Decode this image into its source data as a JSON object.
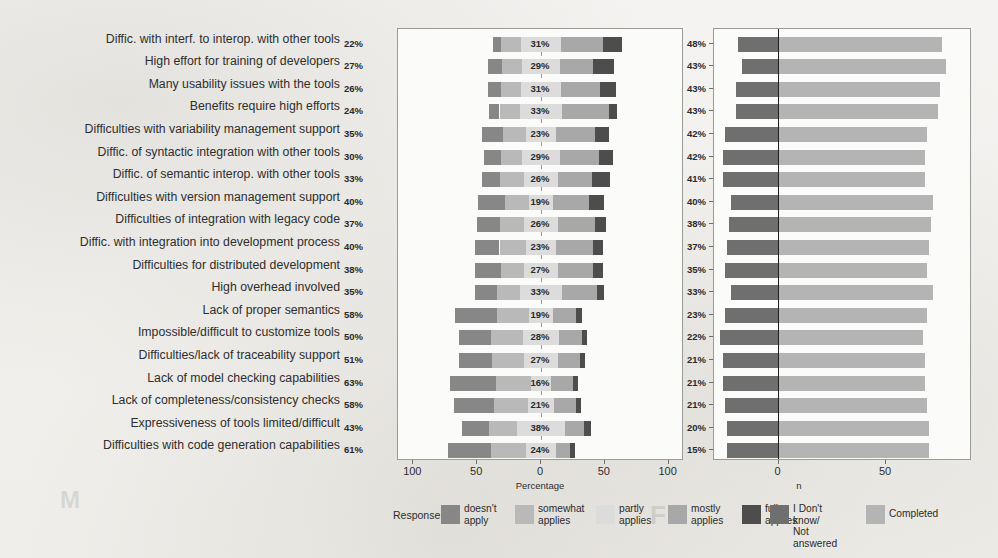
{
  "figure": {
    "left_axis_title": "Percentage",
    "right_axis_title": "n",
    "left_ticks": [
      "100",
      "50",
      "0",
      "50",
      "100"
    ],
    "right_ticks": [
      "0",
      "50"
    ]
  },
  "legend": {
    "left_title": "Response",
    "left_items": [
      {
        "label": "doesn't\napply",
        "color": "#878787"
      },
      {
        "label": "somewhat\napplies",
        "color": "#b9b9b9"
      },
      {
        "label": "partly\napplies",
        "color": "#dcdcdc"
      },
      {
        "label": "mostly\napplies",
        "color": "#a8a8a8"
      },
      {
        "label": "fully\napplies",
        "color": "#4d4d4d"
      }
    ],
    "right_items": [
      {
        "label": "I Don't know/\nNot answered",
        "color": "#6f6f6f"
      },
      {
        "label": "Completed",
        "color": "#b4b4b4"
      }
    ]
  },
  "colors": {
    "doesnt_apply": "#878787",
    "somewhat_applies": "#b9b9b9",
    "partly_applies": "#dcdcdc",
    "mostly_applies": "#a8a8a8",
    "fully_applies": "#4d4d4d",
    "not_answered": "#6f6f6f",
    "completed": "#b4b4b4",
    "panel_border": "#9a9a96",
    "zero_line": "#1f1f1f"
  },
  "chart_data": {
    "type": "bar",
    "title": "",
    "subtype": "diverging-stacked-likert + companion count bar",
    "xlabel": "Percentage",
    "ylabel": "",
    "xlim": [
      -100,
      100
    ],
    "grid": false,
    "legend_position": "bottom",
    "series": [
      {
        "name": "doesn't apply",
        "color": "#878787"
      },
      {
        "name": "somewhat applies",
        "color": "#b9b9b9"
      },
      {
        "name": "partly applies",
        "color": "#dcdcdc"
      },
      {
        "name": "mostly applies",
        "color": "#a8a8a8"
      },
      {
        "name": "fully applies",
        "color": "#4d4d4d"
      }
    ],
    "categories": [
      "Diffic. with interf. to interop. with other tools",
      "High effort for training of developers",
      "Many usability issues with the tools",
      "Benefits require high efforts",
      "Difficulties with variability management support",
      "Diffic. of syntactic integration with other tools",
      "Diffic. of semantic interop. with other tools",
      "Difficulties with version management support",
      "Difficulties of integration with legacy code",
      "Diffic. with integration into development process",
      "Difficulties for distributed development",
      "High overhead involved",
      "Lack of proper semantics",
      "Impossible/difficult to customize tools",
      "Difficulties/lack of traceability support",
      "Lack of model checking capabilities",
      "Lack of completeness/consistency checks",
      "Expressiveness of tools limited/difficult",
      "Difficulties with code generation capabilities"
    ],
    "rows": [
      {
        "label": "Diffic. with interf. to interop. with other tools",
        "negative_pct": 22,
        "neutral_pct": 31,
        "positive_pct": 48,
        "doesnt_apply": 6,
        "somewhat_applies": 16,
        "partly_applies": 31,
        "mostly_applies": 33,
        "fully_applies": 15,
        "n_not_answered": 19,
        "n_completed": 76
      },
      {
        "label": "High effort for training of developers",
        "negative_pct": 27,
        "neutral_pct": 29,
        "positive_pct": 43,
        "doesnt_apply": 11,
        "somewhat_applies": 16,
        "partly_applies": 29,
        "mostly_applies": 26,
        "fully_applies": 17,
        "n_not_answered": 17,
        "n_completed": 78
      },
      {
        "label": "Many usability issues with the tools",
        "negative_pct": 26,
        "neutral_pct": 31,
        "positive_pct": 43,
        "doesnt_apply": 10,
        "somewhat_applies": 16,
        "partly_applies": 31,
        "mostly_applies": 31,
        "fully_applies": 12,
        "n_not_answered": 20,
        "n_completed": 75
      },
      {
        "label": "Benefits require high efforts",
        "negative_pct": 24,
        "neutral_pct": 33,
        "positive_pct": 43,
        "doesnt_apply": 8,
        "somewhat_applies": 16,
        "partly_applies": 33,
        "mostly_applies": 37,
        "fully_applies": 6,
        "n_not_answered": 20,
        "n_completed": 74
      },
      {
        "label": "Difficulties with variability management support",
        "negative_pct": 35,
        "neutral_pct": 23,
        "positive_pct": 42,
        "doesnt_apply": 17,
        "somewhat_applies": 18,
        "partly_applies": 23,
        "mostly_applies": 31,
        "fully_applies": 11,
        "n_not_answered": 25,
        "n_completed": 69
      },
      {
        "label": "Diffic. of syntactic integration with other tools",
        "negative_pct": 30,
        "neutral_pct": 29,
        "positive_pct": 42,
        "doesnt_apply": 13,
        "somewhat_applies": 17,
        "partly_applies": 29,
        "mostly_applies": 31,
        "fully_applies": 11,
        "n_not_answered": 26,
        "n_completed": 68
      },
      {
        "label": "Diffic. of semantic interop. with other tools",
        "negative_pct": 33,
        "neutral_pct": 26,
        "positive_pct": 41,
        "doesnt_apply": 14,
        "somewhat_applies": 19,
        "partly_applies": 26,
        "mostly_applies": 27,
        "fully_applies": 14,
        "n_not_answered": 26,
        "n_completed": 68
      },
      {
        "label": "Difficulties with version management support",
        "negative_pct": 40,
        "neutral_pct": 19,
        "positive_pct": 40,
        "doesnt_apply": 21,
        "somewhat_applies": 19,
        "partly_applies": 19,
        "mostly_applies": 28,
        "fully_applies": 12,
        "n_not_answered": 22,
        "n_completed": 72
      },
      {
        "label": "Difficulties of integration with legacy code",
        "negative_pct": 37,
        "neutral_pct": 26,
        "positive_pct": 38,
        "doesnt_apply": 18,
        "somewhat_applies": 19,
        "partly_applies": 26,
        "mostly_applies": 29,
        "fully_applies": 9,
        "n_not_answered": 23,
        "n_completed": 71
      },
      {
        "label": "Diffic. with integration into development process",
        "negative_pct": 40,
        "neutral_pct": 23,
        "positive_pct": 37,
        "doesnt_apply": 19,
        "somewhat_applies": 21,
        "partly_applies": 23,
        "mostly_applies": 29,
        "fully_applies": 8,
        "n_not_answered": 24,
        "n_completed": 70
      },
      {
        "label": "Difficulties for distributed development",
        "negative_pct": 38,
        "neutral_pct": 27,
        "positive_pct": 35,
        "doesnt_apply": 20,
        "somewhat_applies": 18,
        "partly_applies": 27,
        "mostly_applies": 27,
        "fully_applies": 8,
        "n_not_answered": 25,
        "n_completed": 69
      },
      {
        "label": "High overhead involved",
        "negative_pct": 35,
        "neutral_pct": 33,
        "positive_pct": 33,
        "doesnt_apply": 17,
        "somewhat_applies": 18,
        "partly_applies": 33,
        "mostly_applies": 27,
        "fully_applies": 6,
        "n_not_answered": 22,
        "n_completed": 72
      },
      {
        "label": "Lack of proper semantics",
        "negative_pct": 58,
        "neutral_pct": 19,
        "positive_pct": 23,
        "doesnt_apply": 33,
        "somewhat_applies": 25,
        "partly_applies": 19,
        "mostly_applies": 18,
        "fully_applies": 5,
        "n_not_answered": 25,
        "n_completed": 69
      },
      {
        "label": "Impossible/difficult to customize tools",
        "negative_pct": 50,
        "neutral_pct": 28,
        "positive_pct": 22,
        "doesnt_apply": 25,
        "somewhat_applies": 25,
        "partly_applies": 28,
        "mostly_applies": 18,
        "fully_applies": 4,
        "n_not_answered": 27,
        "n_completed": 67
      },
      {
        "label": "Difficulties/lack of traceability support",
        "negative_pct": 51,
        "neutral_pct": 27,
        "positive_pct": 21,
        "doesnt_apply": 26,
        "somewhat_applies": 25,
        "partly_applies": 27,
        "mostly_applies": 17,
        "fully_applies": 4,
        "n_not_answered": 26,
        "n_completed": 68
      },
      {
        "label": "Lack of model checking capabilities",
        "negative_pct": 63,
        "neutral_pct": 16,
        "positive_pct": 21,
        "doesnt_apply": 36,
        "somewhat_applies": 27,
        "partly_applies": 16,
        "mostly_applies": 17,
        "fully_applies": 4,
        "n_not_answered": 26,
        "n_completed": 68
      },
      {
        "label": "Lack of completeness/consistency checks",
        "negative_pct": 58,
        "neutral_pct": 21,
        "positive_pct": 21,
        "doesnt_apply": 32,
        "somewhat_applies": 26,
        "partly_applies": 21,
        "mostly_applies": 17,
        "fully_applies": 4,
        "n_not_answered": 25,
        "n_completed": 69
      },
      {
        "label": "Expressiveness of tools limited/difficult",
        "negative_pct": 43,
        "neutral_pct": 38,
        "positive_pct": 20,
        "doesnt_apply": 21,
        "somewhat_applies": 22,
        "partly_applies": 38,
        "mostly_applies": 15,
        "fully_applies": 5,
        "n_not_answered": 24,
        "n_completed": 70
      },
      {
        "label": "Difficulties with code generation capabilities",
        "negative_pct": 61,
        "neutral_pct": 24,
        "positive_pct": 15,
        "doesnt_apply": 34,
        "somewhat_applies": 27,
        "partly_applies": 24,
        "mostly_applies": 11,
        "fully_applies": 4,
        "n_not_answered": 24,
        "n_completed": 70
      }
    ],
    "count_panel": {
      "xlabel": "n",
      "xlim": [
        -30,
        90
      ],
      "series": [
        {
          "name": "I Don't know/Not answered",
          "color": "#6f6f6f"
        },
        {
          "name": "Completed",
          "color": "#b4b4b4"
        }
      ]
    }
  }
}
